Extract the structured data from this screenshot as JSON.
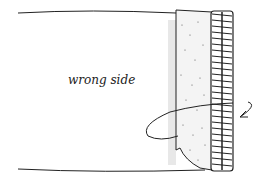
{
  "diagram": {
    "label": "wrong side",
    "elements": [
      "fabric-panel",
      "folded-seam-allowance",
      "serged-edge",
      "curved-fold-arrow"
    ],
    "colors": {
      "ink": "#222222",
      "paper": "#ffffff",
      "stipple": "#555555"
    }
  }
}
